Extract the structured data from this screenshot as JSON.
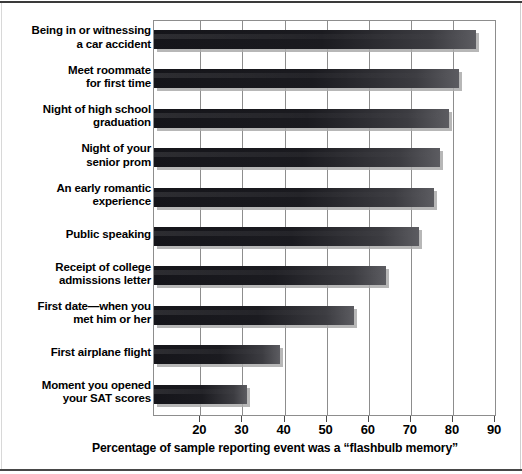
{
  "figure": {
    "background": "#ffffff",
    "bar_color": "#17171c",
    "grid_color": "#8d8d8d"
  },
  "axis": {
    "title": "Percentage of sample reporting event was a “flashbulb memory”",
    "tick_labels": [
      "20",
      "30",
      "40",
      "50",
      "60",
      "70",
      "80",
      "90"
    ]
  },
  "chart_data": {
    "type": "bar",
    "orientation": "horizontal",
    "title": "",
    "xlabel": "Percentage of sample reporting event was a “flashbulb memory”",
    "ylabel": "",
    "xlim": [
      9,
      90
    ],
    "xticks": [
      20,
      30,
      40,
      50,
      60,
      70,
      80,
      90
    ],
    "grid": true,
    "legend": false,
    "categories": [
      "Being in or witnessing a car accident",
      "Meet roommate for first time",
      "Night of high school graduation",
      "Night of your senior prom",
      "An early romantic experience",
      "Public speaking",
      "Receipt of college admissions letter",
      "First date—when you met him or her",
      "First airplane flight",
      "Moment you opened your SAT scores"
    ],
    "category_lines": [
      [
        "Being in or witnessing",
        "a car accident"
      ],
      [
        "Meet roommate",
        "for first time"
      ],
      [
        "Night of high school",
        "graduation"
      ],
      [
        "Night of your",
        "senior prom"
      ],
      [
        "An early romantic",
        "experience"
      ],
      [
        "Public speaking"
      ],
      [
        "Receipt of college",
        "admissions letter"
      ],
      [
        "First date—when you",
        "met him or her"
      ],
      [
        "First airplane flight"
      ],
      [
        "Moment you opened",
        "your SAT scores"
      ]
    ],
    "values": [
      85.5,
      81.5,
      79,
      77,
      75.5,
      72,
      64,
      56.5,
      39,
      31
    ]
  }
}
